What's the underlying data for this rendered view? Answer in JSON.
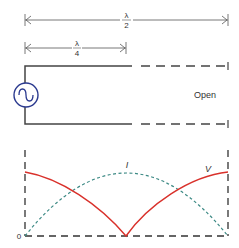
{
  "dimensions": {
    "half_wave_label_num": "λ",
    "half_wave_label_den": "2",
    "quarter_wave_label_num": "λ",
    "quarter_wave_label_den": "4"
  },
  "line": {
    "termination_label": "Open"
  },
  "plot": {
    "current_label": "I",
    "voltage_label": "V",
    "origin_label": "0"
  },
  "colors": {
    "line": "#444444",
    "source": "#2b3a8f",
    "voltage": "#d9312b",
    "current": "#3d8a85"
  }
}
